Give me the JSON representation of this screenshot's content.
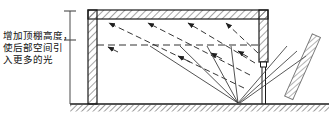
{
  "figure": {
    "kind": "architectural-section-daylighting-diagram",
    "annotation": {
      "full_text": "增加顶棚高度，使后部空间引入更多的光",
      "lines": [
        "增加顶棚高度，",
        "使后部空间引",
        "入更多的光"
      ]
    },
    "colors": {
      "ink": "#1a1a1a",
      "hatch": "#555555",
      "ray": "#2b2b2b",
      "ground": "#4a4a4a",
      "background": "#ffffff"
    },
    "elements": {
      "ceiling_label": "顶棚",
      "left_wall_label": "后墙",
      "right_wall_label": "采光侧墙",
      "window_label": "侧窗",
      "reflector_label": "室外反光板",
      "ground_label": "地面",
      "height_dimension_label": "顶棚高度",
      "reflected_ray_label": "反射光线",
      "incident_ray_label": "入射光线"
    },
    "geometry": {
      "building": {
        "outer_left": 88,
        "outer_right": 268,
        "outer_top": 10,
        "ground_y": 104,
        "wall_thickness": 9,
        "ceiling_thickness": 9
      },
      "interior": {
        "left": 97,
        "right": 259,
        "top": 19,
        "bottom": 104
      },
      "dimension_line": {
        "x": 70,
        "top": 11,
        "bottom": 104,
        "ticks": [
          11,
          40
        ]
      },
      "horizontal_dashed_guide": {
        "y": 45,
        "x1": 97,
        "x2": 259
      },
      "interior_dashed_rays": [
        {
          "x1": 244,
          "y1": 88,
          "x2": 107,
          "y2": 22
        },
        {
          "x1": 252,
          "y1": 74,
          "x2": 146,
          "y2": 22
        },
        {
          "x1": 256,
          "y1": 62,
          "x2": 186,
          "y2": 22
        },
        {
          "x1": 258,
          "y1": 52,
          "x2": 224,
          "y2": 22
        }
      ],
      "ground_convergence_point": {
        "x": 238,
        "y": 103
      },
      "incoming_solid_rays": [
        {
          "x1": 238,
          "y1": 103,
          "x2": 150,
          "y2": 47
        },
        {
          "x1": 238,
          "y1": 103,
          "x2": 179,
          "y2": 47
        },
        {
          "x1": 238,
          "y1": 103,
          "x2": 206,
          "y2": 47
        },
        {
          "x1": 238,
          "y1": 103,
          "x2": 231,
          "y2": 47
        }
      ],
      "exterior_rays": [
        {
          "x1": 238,
          "y1": 103,
          "x2": 286,
          "y2": 48
        },
        {
          "x1": 238,
          "y1": 103,
          "x2": 296,
          "y2": 52
        },
        {
          "x1": 238,
          "y1": 103,
          "x2": 305,
          "y2": 57
        }
      ],
      "reflector": {
        "x1": 291,
        "y1": 40,
        "x2": 315,
        "y2": 95,
        "width": 9,
        "angle_deg": 66
      },
      "ground_line": {
        "x1": 70,
        "x2": 329,
        "y": 104,
        "hatch_depth": 7
      }
    }
  }
}
